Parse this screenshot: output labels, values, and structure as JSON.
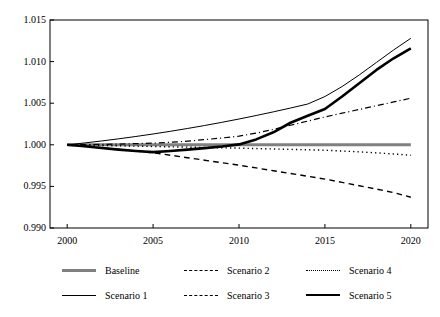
{
  "chart_data": {
    "type": "line",
    "title": "",
    "xlabel": "",
    "ylabel": "",
    "x": [
      2000,
      2001,
      2002,
      2003,
      2004,
      2005,
      2006,
      2007,
      2008,
      2009,
      2010,
      2011,
      2012,
      2013,
      2014,
      2015,
      2016,
      2017,
      2018,
      2019,
      2020
    ],
    "xlim": [
      1999,
      2021
    ],
    "ylim": [
      0.99,
      1.015
    ],
    "xticks": [
      2000,
      2005,
      2010,
      2015,
      2020
    ],
    "xtick_labels": [
      "2000",
      "2005",
      "2010",
      "2015",
      "2020"
    ],
    "yticks": [
      0.99,
      0.995,
      1.0,
      1.005,
      1.01,
      1.015
    ],
    "ytick_labels": [
      "0.990",
      "0.995",
      "1.000",
      "1.005",
      "1.010",
      "1.015"
    ],
    "grid": false,
    "legend_position": "below",
    "legend_columns": 3,
    "series": [
      {
        "name": "Baseline",
        "style": "solid",
        "width": 3,
        "color": "#808080",
        "values": [
          1.0,
          1.0,
          1.0,
          1.0,
          1.0,
          1.0,
          1.0,
          1.0,
          1.0,
          1.0,
          1.0,
          1.0,
          1.0,
          1.0,
          1.0,
          1.0,
          1.0,
          1.0,
          1.0,
          1.0,
          1.0
        ]
      },
      {
        "name": "Scenario 1",
        "style": "solid",
        "width": 1,
        "color": "#000000",
        "values": [
          1.0,
          1.00022,
          1.00046,
          1.00072,
          1.001,
          1.0013,
          1.00162,
          1.00196,
          1.00232,
          1.0027,
          1.0031,
          1.00352,
          1.00396,
          1.00442,
          1.0049,
          1.0058,
          1.007,
          1.0084,
          1.0099,
          1.0114,
          1.0128
        ]
      },
      {
        "name": "Scenario 2",
        "style": "dashdot",
        "width": 1.2,
        "color": "#000000",
        "values": [
          1.0,
          1.00002,
          1.00005,
          1.00009,
          1.00014,
          1.0002,
          1.0003,
          1.00044,
          1.00062,
          1.00082,
          1.00104,
          1.0014,
          1.00185,
          1.00235,
          1.00285,
          1.00335,
          1.0038,
          1.00425,
          1.0047,
          1.00515,
          1.0056
        ]
      },
      {
        "name": "Scenario 3",
        "style": "dashed",
        "width": 1.4,
        "color": "#000000",
        "values": [
          1.0,
          0.99985,
          0.99965,
          0.99945,
          0.99925,
          0.99905,
          0.99875,
          0.99845,
          0.99815,
          0.99785,
          0.99755,
          0.99722,
          0.99688,
          0.99655,
          0.99622,
          0.99588,
          0.99548,
          0.99508,
          0.99468,
          0.99425,
          0.9937
        ]
      },
      {
        "name": "Scenario 4",
        "style": "dotted",
        "width": 1.4,
        "color": "#000000",
        "values": [
          1.0,
          0.99996,
          0.99992,
          0.99988,
          0.99984,
          0.9998,
          0.99976,
          0.99972,
          0.99968,
          0.99964,
          0.9996,
          0.99955,
          0.9995,
          0.99945,
          0.9994,
          0.99935,
          0.99925,
          0.99915,
          0.99903,
          0.9989,
          0.99875
        ]
      },
      {
        "name": "Scenario 5",
        "style": "solid",
        "width": 2.6,
        "color": "#000000",
        "values": [
          1.0,
          0.99982,
          0.99962,
          0.99942,
          0.99925,
          0.99912,
          0.99925,
          0.99942,
          0.9996,
          0.9998,
          1.00005,
          1.00065,
          1.0015,
          1.00265,
          1.0035,
          1.0043,
          1.0058,
          1.0074,
          1.009,
          1.0104,
          1.0116
        ]
      }
    ]
  },
  "legend": {
    "items": [
      {
        "label": "Baseline"
      },
      {
        "label": "Scenario 2"
      },
      {
        "label": "Scenario 4"
      },
      {
        "label": "Scenario 1"
      },
      {
        "label": "Scenario 3"
      },
      {
        "label": "Scenario 5"
      }
    ]
  }
}
